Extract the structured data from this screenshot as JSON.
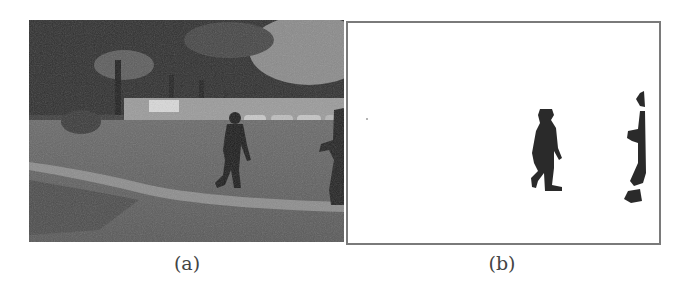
{
  "figure": {
    "panels": [
      {
        "id": "a",
        "label": "(a)",
        "description": "Grayscale outdoor scene: trees, parked cars, lawn with curb, a person walking and a second partial person at right edge"
      },
      {
        "id": "b",
        "label": "(b)",
        "description": "Binary foreground segmentation mask: two dark silhouettes of walking people on white background"
      }
    ],
    "colors": {
      "mask_foreground": "#2a2a2a",
      "mask_background": "#ffffff",
      "frame_border": "#7a7a7a"
    }
  }
}
